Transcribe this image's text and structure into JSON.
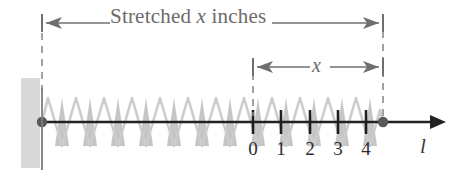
{
  "figure": {
    "title_label": "Stretched x inches",
    "title_prefix": "Stretched ",
    "title_var": "x",
    "title_suffix": " inches",
    "inner_dimension_label": "x",
    "axis_label": "l",
    "tick_labels": [
      "0",
      "1",
      "2",
      "3",
      "4"
    ],
    "colors": {
      "text_gray": "#6b6b6b",
      "axis_dark": "#222222",
      "wall_gray": "#d8d8d8",
      "spring_outline": "#cfcfcf",
      "spring_fill": "#b9b9b9",
      "dash_gray": "#8a8a8a",
      "number_dark": "#2e2e2e"
    },
    "geometry": {
      "wall_x": 21,
      "wall_width": 19,
      "anchor_x": 42,
      "spring_end_x": 383,
      "axis_y": 122,
      "axis_arrow_x": 442,
      "tick_x_positions": [
        253,
        281,
        310,
        338,
        366
      ],
      "outer_arrow_y": 22,
      "inner_arrow_y": 66,
      "inner_arrow_left_x": 253,
      "inner_arrow_right_x": 383
    }
  }
}
